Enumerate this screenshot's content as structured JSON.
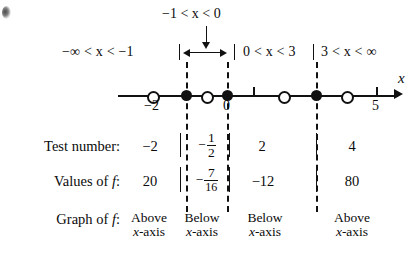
{
  "figure": {
    "type": "sign-chart-number-line",
    "axis_label": "x",
    "top_bracket_label": "−1 < x < 0",
    "intervals": [
      {
        "id": "i1",
        "label": "−∞ < x < −1"
      },
      {
        "id": "i2",
        "label": "−1 < x < 0"
      },
      {
        "id": "i3",
        "label": "0 < x < 3"
      },
      {
        "id": "i4",
        "label": "3 < x < ∞"
      }
    ],
    "axis_tick_labels": [
      {
        "value": "−2",
        "x": 152
      },
      {
        "value": "0",
        "x": 227
      },
      {
        "value": "5",
        "x": 376
      }
    ],
    "axis_points": [
      {
        "kind": "open-circle",
        "x": 152
      },
      {
        "kind": "filled-circle",
        "x": 186
      },
      {
        "kind": "open-circle",
        "x": 206
      },
      {
        "kind": "filled-circle",
        "x": 227
      },
      {
        "kind": "tick",
        "x": 253
      },
      {
        "kind": "open-circle",
        "x": 283
      },
      {
        "kind": "filled-circle",
        "x": 316
      },
      {
        "kind": "open-circle",
        "x": 346
      },
      {
        "kind": "tick",
        "x": 376
      }
    ],
    "boundaries": [
      186,
      227,
      316
    ]
  },
  "table": {
    "rows": [
      {
        "label": "Test number:",
        "values": [
          "−2",
          "−½",
          "2",
          "4"
        ],
        "fraction_cell": {
          "index": 1,
          "sign": "−",
          "numerator": "1",
          "denominator": "2"
        }
      },
      {
        "label": "Values of ƒ:",
        "values": [
          "20",
          "−7/16",
          "−12",
          "80"
        ],
        "fraction_cell": {
          "index": 1,
          "sign": "−",
          "numerator": "7",
          "denominator": "16"
        }
      },
      {
        "label": "Graph of ƒ:",
        "values": [
          "Above x-axis",
          "Below x-axis",
          "Below x-axis",
          "Above x-axis"
        ],
        "lines": [
          {
            "top": "Above",
            "bottom": "x-axis"
          },
          {
            "top": "Below",
            "bottom": "x-axis"
          },
          {
            "top": "Below",
            "bottom": "x-axis"
          },
          {
            "top": "Above",
            "bottom": "x-axis"
          }
        ]
      }
    ]
  },
  "colors": {
    "ink": "#111111",
    "background": "#ffffff"
  }
}
